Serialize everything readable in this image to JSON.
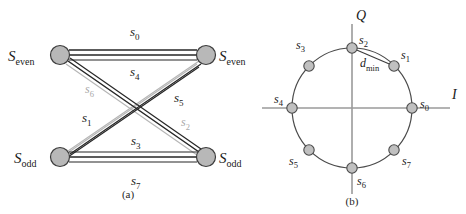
{
  "figure": {
    "panels": [
      {
        "id": "a",
        "caption": "(a)",
        "type": "trellis-state-transition-diagram",
        "nodes": [
          {
            "id": "n-top-left",
            "label_var": "S",
            "label_sub": "even",
            "x": 60,
            "y": 55,
            "r": 9.5
          },
          {
            "id": "n-top-right",
            "label_var": "S",
            "label_sub": "even",
            "x": 206,
            "y": 55,
            "r": 9.5
          },
          {
            "id": "n-bottom-left",
            "label_var": "S",
            "label_sub": "odd",
            "x": 60,
            "y": 157,
            "r": 9.5
          },
          {
            "id": "n-bottom-right",
            "label_var": "S",
            "label_sub": "odd",
            "x": 206,
            "y": 157,
            "r": 9.5
          }
        ],
        "edge_labels": [
          {
            "id": "edge-label-s0",
            "var": "s",
            "sub": "0",
            "x": 130,
            "y": 36,
            "shade": "dark"
          },
          {
            "id": "edge-label-s4",
            "var": "s",
            "sub": "4",
            "x": 130,
            "y": 74,
            "shade": "dark"
          },
          {
            "id": "edge-label-s6",
            "var": "s",
            "sub": "6",
            "x": 88,
            "y": 93,
            "shade": "light"
          },
          {
            "id": "edge-label-s5",
            "var": "s",
            "sub": "5",
            "x": 178,
            "y": 100,
            "shade": "dark"
          },
          {
            "id": "edge-label-s1",
            "var": "s",
            "sub": "1",
            "x": 85,
            "y": 120,
            "shade": "dark"
          },
          {
            "id": "edge-label-s2",
            "var": "s",
            "sub": "2",
            "x": 184,
            "y": 124,
            "shade": "light"
          },
          {
            "id": "edge-label-s3",
            "var": "s",
            "sub": "3",
            "x": 133,
            "y": 143,
            "shade": "dark"
          },
          {
            "id": "edge-label-s7",
            "var": "s",
            "sub": "7",
            "x": 133,
            "y": 183,
            "shade": "dark"
          }
        ]
      },
      {
        "id": "b",
        "caption": "(b)",
        "type": "8psk-constellation",
        "circle": {
          "cx": 352,
          "cy": 108,
          "r": 60
        },
        "axes": {
          "i_label": "I",
          "q_label": "Q",
          "i_label_x": 455,
          "i_label_y": 99,
          "q_label_x": 357,
          "q_label_y": 18,
          "x_min": 262,
          "x_max": 450,
          "y_min": 24,
          "y_max": 194
        },
        "distance_annotation": {
          "id": "d-min",
          "var": "d",
          "sub": "min",
          "from_point": "s2",
          "to_point": "s1",
          "x": 366,
          "y": 63
        },
        "points": [
          {
            "id": "s0",
            "var": "s",
            "sub": "0",
            "angle_deg": 0,
            "x": 412,
            "y": 108,
            "label_x": 421,
            "label_y": 104
          },
          {
            "id": "s1",
            "var": "s",
            "sub": "1",
            "angle_deg": 45,
            "x": 394,
            "y": 66,
            "label_x": 402,
            "label_y": 59
          },
          {
            "id": "s2",
            "var": "s",
            "sub": "2",
            "angle_deg": 90,
            "x": 352,
            "y": 48,
            "label_x": 360,
            "label_y": 41
          },
          {
            "id": "s3",
            "var": "s",
            "sub": "3",
            "angle_deg": 135,
            "x": 309,
            "y": 66,
            "label_x": 298,
            "label_y": 48
          },
          {
            "id": "s4",
            "var": "s",
            "sub": "4",
            "angle_deg": 180,
            "x": 292,
            "y": 108,
            "label_x": 277,
            "label_y": 102
          },
          {
            "id": "s5",
            "var": "s",
            "sub": "5",
            "angle_deg": 225,
            "x": 309,
            "y": 150,
            "label_x": 292,
            "label_y": 163
          },
          {
            "id": "s6",
            "var": "s",
            "sub": "6",
            "angle_deg": 270,
            "x": 352,
            "y": 168,
            "label_x": 358,
            "label_y": 180
          },
          {
            "id": "s7",
            "var": "s",
            "sub": "7",
            "angle_deg": 315,
            "x": 394,
            "y": 150,
            "label_x": 403,
            "label_y": 163
          }
        ]
      }
    ],
    "captions": {
      "a": {
        "text": "(a)",
        "x": 128,
        "y": 196
      },
      "b": {
        "text": "(b)",
        "x": 348,
        "y": 203
      }
    },
    "colors": {
      "background": "#ffffff",
      "node_fill": "#b8b8b8",
      "node_stroke": "#3c3c3c",
      "edge_dark": "#2b2b2b",
      "edge_light": "#b3b3b3",
      "axis": "#9a9a9a",
      "circle_stroke": "#4a4a4a",
      "text": "#1a1a1a",
      "text_faded": "#a8a8a8"
    }
  }
}
